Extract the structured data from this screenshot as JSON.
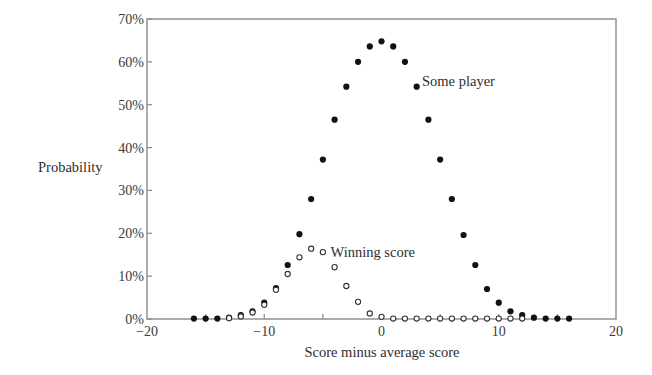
{
  "chart_data": {
    "type": "scatter",
    "title": "",
    "xlabel": "Score minus average score",
    "ylabel": "Probability",
    "xlim": [
      -20,
      20
    ],
    "ylim": [
      0,
      70
    ],
    "grid": false,
    "legend": "none (inline annotations)",
    "x_ticks": [
      -20,
      -10,
      0,
      10,
      20
    ],
    "x_tick_labels": [
      "−20",
      "−10",
      "0",
      "10",
      "20"
    ],
    "x_minor_ticks": [
      -15,
      -10,
      -5,
      0,
      5,
      10,
      15
    ],
    "y_ticks": [
      0,
      10,
      20,
      30,
      40,
      50,
      60,
      70
    ],
    "y_tick_labels": [
      "0%",
      "10%",
      "20%",
      "30%",
      "40%",
      "50%",
      "60%",
      "70%"
    ],
    "series": [
      {
        "name": "Some player",
        "marker": "filled-circle",
        "x": [
          -16,
          -15,
          -14,
          -13,
          -12,
          -11,
          -10,
          -9,
          -8,
          -7,
          -6,
          -5,
          -4,
          -3,
          -2,
          -1,
          0,
          1,
          2,
          3,
          4,
          5,
          6,
          7,
          8,
          9,
          10,
          11,
          12,
          13,
          14,
          15,
          16
        ],
        "values": [
          0.1,
          0.1,
          0.1,
          0.3,
          0.9,
          1.8,
          3.8,
          7.2,
          12.6,
          19.8,
          28.0,
          37.2,
          46.5,
          54.2,
          60.0,
          63.6,
          64.8,
          63.6,
          60.0,
          54.2,
          46.5,
          37.2,
          28.0,
          19.6,
          12.6,
          7.0,
          3.8,
          1.8,
          0.9,
          0.3,
          0.1,
          0.1,
          0.1
        ]
      },
      {
        "name": "Winning score",
        "marker": "open-circle",
        "x": [
          -13,
          -12,
          -11,
          -10,
          -9,
          -8,
          -7,
          -6,
          -5,
          -4,
          -3,
          -2,
          -1,
          0,
          1,
          2,
          3,
          4,
          5,
          6,
          7,
          8,
          9,
          10,
          11,
          12
        ],
        "values": [
          0.2,
          0.6,
          1.5,
          3.3,
          6.8,
          10.5,
          14.4,
          16.4,
          15.6,
          12.1,
          7.7,
          4.0,
          1.3,
          0.5,
          0.1,
          0.1,
          0.1,
          0.1,
          0.1,
          0.1,
          0.1,
          0.1,
          0.1,
          0.1,
          0.1,
          0.1
        ]
      }
    ],
    "annotations": [
      {
        "text": "Some player",
        "x": 3.2,
        "y": 54.5
      },
      {
        "text": "Winning score",
        "x": -4.6,
        "y": 15.3
      }
    ]
  },
  "labels": {
    "ylabel": "Probability",
    "xlabel": "Score minus average score",
    "annot_some_player": "Some player",
    "annot_winning": "Winning score"
  },
  "colors": {
    "axis": "#8a8a8a",
    "filled_marker": "#111111",
    "open_marker_stroke": "#333333",
    "text": "#333333"
  }
}
